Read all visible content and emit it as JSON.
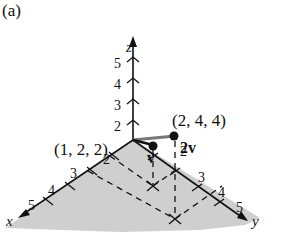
{
  "figure": {
    "panel_label": "(a)",
    "axes": {
      "x_label": "x",
      "y_label": "y",
      "z_label": "z",
      "z_ticks": [
        "2",
        "3",
        "4",
        "5"
      ],
      "x_ticks": [
        "2",
        "3",
        "4",
        "5"
      ],
      "y_ticks": [
        "2",
        "3",
        "4",
        "5"
      ]
    },
    "points": [
      {
        "label": "(1, 2, 2)",
        "vector": "v"
      },
      {
        "label": "(2, 4, 4)",
        "vector": "2v"
      }
    ],
    "colors": {
      "floor": "#c8c8c8",
      "ink": "#111111"
    }
  }
}
